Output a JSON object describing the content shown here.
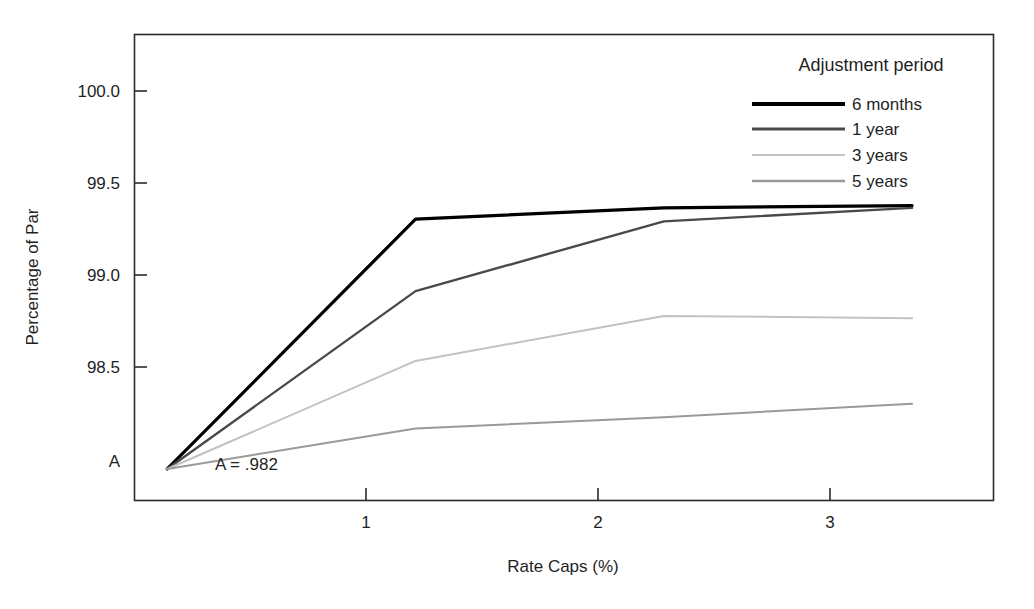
{
  "chart_data": {
    "type": "line",
    "title": "",
    "xlabel": "Rate Caps (%)",
    "ylabel": "Percentage of Par",
    "x": [
      0,
      1,
      2,
      3
    ],
    "xlim": [
      -0.13,
      3.33
    ],
    "ylim": [
      98.06,
      100.13
    ],
    "xticks": [
      1,
      2,
      3
    ],
    "xtick_labels": [
      "1",
      "2",
      "3"
    ],
    "yticks": [
      98.2,
      98.5,
      99.0,
      99.5,
      100.0
    ],
    "ytick_labels": [
      "A",
      "98.5",
      "99.0",
      "99.5",
      "100.0"
    ],
    "grid": false,
    "legend_position": "top-right",
    "legend_title": "Adjustment period",
    "annotations": [
      {
        "text": "A = .982",
        "x": 0.27,
        "y": 98.22
      }
    ],
    "series": [
      {
        "name": "6 months",
        "values": [
          98.2,
          99.31,
          99.36,
          99.37
        ],
        "color": "#000000",
        "width": 3.2
      },
      {
        "name": "1 year",
        "values": [
          98.2,
          98.99,
          99.3,
          99.36
        ],
        "color": "#4a4a4a",
        "width": 2.4
      },
      {
        "name": "3 years",
        "values": [
          98.2,
          98.68,
          98.88,
          98.87
        ],
        "color": "#c2c2c2",
        "width": 2.0
      },
      {
        "name": "5 years",
        "values": [
          98.2,
          98.38,
          98.43,
          98.49
        ],
        "color": "#9a9a9a",
        "width": 2.0
      }
    ]
  },
  "axes": {
    "y_tick_100": "100.0",
    "y_tick_995": "99.5",
    "y_tick_990": "99.0",
    "y_tick_985": "98.5",
    "y_tick_A": "A",
    "x_tick_1": "1",
    "x_tick_2": "2",
    "x_tick_3": "3",
    "x_title": "Rate Caps (%)",
    "y_title": "Percentage of Par"
  },
  "annotation": {
    "base_value": "A = .982"
  },
  "legend": {
    "title": "Adjustment period",
    "items": [
      {
        "label": "6 months"
      },
      {
        "label": "1 year"
      },
      {
        "label": "3 years"
      },
      {
        "label": "5 years"
      }
    ]
  },
  "colors": {
    "frame": "#2a2a2a",
    "background": "#ffffff",
    "series_6_months": "#000000",
    "series_1_year": "#4a4a4a",
    "series_3_years": "#c2c2c2",
    "series_5_years": "#9a9a9a"
  }
}
